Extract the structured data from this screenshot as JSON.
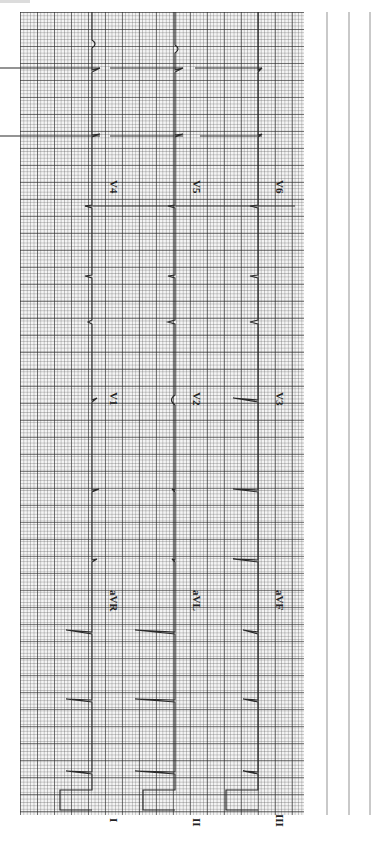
{
  "ecg": {
    "orientation": "rotated-90",
    "grid_color": "#555555",
    "trace_color": "#2a2a2a",
    "rows": [
      {
        "leads": [
          "I",
          "aVR",
          "V1",
          "V4"
        ]
      },
      {
        "leads": [
          "II",
          "aVL",
          "V2",
          "V5"
        ]
      },
      {
        "leads": [
          "III",
          "aVF",
          "V3",
          "V6"
        ]
      }
    ],
    "labels": {
      "I": "I",
      "II": "II",
      "III": "III",
      "aVR": "aVR",
      "aVL": "aVL",
      "aVF": "aVF",
      "V1": "V1",
      "V2": "V2",
      "V3": "V3",
      "V4": "V4",
      "V5": "V5",
      "V6": "V6"
    }
  }
}
